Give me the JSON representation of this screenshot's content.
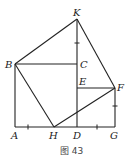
{
  "figure": {
    "caption": "图 43",
    "points": {
      "K": {
        "label": "K",
        "x": 77,
        "y": 19
      },
      "B": {
        "label": "B",
        "x": 15,
        "y": 64
      },
      "C": {
        "label": "C",
        "x": 77,
        "y": 64
      },
      "E": {
        "label": "E",
        "x": 77,
        "y": 88
      },
      "F": {
        "label": "F",
        "x": 115,
        "y": 88
      },
      "A": {
        "label": "A",
        "x": 15,
        "y": 127
      },
      "H": {
        "label": "H",
        "x": 54,
        "y": 127
      },
      "D": {
        "label": "D",
        "x": 77,
        "y": 127
      },
      "G": {
        "label": "G",
        "x": 115,
        "y": 127
      }
    },
    "segments": [
      [
        "B",
        "K"
      ],
      [
        "K",
        "F"
      ],
      [
        "F",
        "H"
      ],
      [
        "H",
        "B"
      ],
      [
        "B",
        "C"
      ],
      [
        "K",
        "D"
      ],
      [
        "E",
        "F"
      ],
      [
        "F",
        "G"
      ],
      [
        "A",
        "G"
      ],
      [
        "B",
        "A"
      ]
    ],
    "equal_marks": [
      "KC",
      "FG",
      "AH",
      "DG"
    ]
  }
}
